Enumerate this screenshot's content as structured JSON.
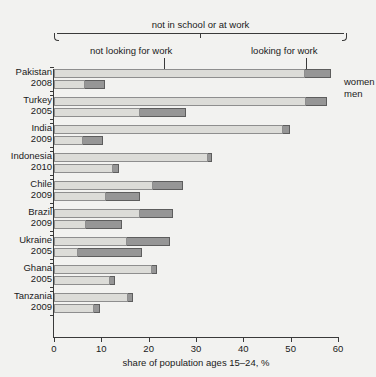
{
  "figure": {
    "cropped_headline": "issue",
    "annotations": {
      "overall_bracket": "not in school or at work",
      "left_segment": "not looking for work",
      "right_segment": "looking for work"
    },
    "legend": {
      "women": "women",
      "men": "men"
    },
    "colors": {
      "not_looking_for_work": "#dcdcd8",
      "looking_for_work": "#969696",
      "axis": "#3a3a3a",
      "background": "#f2f2f0"
    }
  },
  "chart_data": {
    "type": "bar",
    "orientation": "horizontal",
    "title": "",
    "xlabel": "share of population ages 15–24, %",
    "ylabel": "",
    "xlim": [
      0,
      60
    ],
    "xticks": [
      0,
      10,
      20,
      30,
      40,
      50,
      60
    ],
    "xticklabels": [
      "0",
      "10",
      "20",
      "30",
      "40",
      "50",
      "60"
    ],
    "grid": false,
    "legend_position": "right",
    "stacked": true,
    "series": [
      {
        "name": "not looking for work",
        "color": "#dcdcd8"
      },
      {
        "name": "looking for work",
        "color": "#969696"
      }
    ],
    "groups": [
      {
        "country": "Pakistan",
        "year": "2008",
        "bars": [
          {
            "sex": "women",
            "not_looking_for_work": 53.0,
            "looking_for_work": 5.5,
            "total": 58.5
          },
          {
            "sex": "men",
            "not_looking_for_work": 6.5,
            "looking_for_work": 4.3,
            "total": 10.8
          }
        ]
      },
      {
        "country": "Turkey",
        "year": "2005",
        "bars": [
          {
            "sex": "women",
            "not_looking_for_work": 53.2,
            "looking_for_work": 4.5,
            "total": 57.7
          },
          {
            "sex": "men",
            "not_looking_for_work": 18.2,
            "looking_for_work": 9.7,
            "total": 27.9
          }
        ]
      },
      {
        "country": "India",
        "year": "2009",
        "bars": [
          {
            "sex": "women",
            "not_looking_for_work": 48.4,
            "looking_for_work": 1.5,
            "total": 49.9
          },
          {
            "sex": "men",
            "not_looking_for_work": 6.1,
            "looking_for_work": 4.2,
            "total": 10.3
          }
        ]
      },
      {
        "country": "Indonesia",
        "year": "2010",
        "bars": [
          {
            "sex": "women",
            "not_looking_for_work": 32.5,
            "looking_for_work": 0.9,
            "total": 33.4
          },
          {
            "sex": "men",
            "not_looking_for_work": 12.5,
            "looking_for_work": 1.2,
            "total": 13.7
          }
        ]
      },
      {
        "country": "Chile",
        "year": "2009",
        "bars": [
          {
            "sex": "women",
            "not_looking_for_work": 20.9,
            "looking_for_work": 6.4,
            "total": 27.3
          },
          {
            "sex": "men",
            "not_looking_for_work": 11.0,
            "looking_for_work": 7.2,
            "total": 18.2
          }
        ]
      },
      {
        "country": "Brazil",
        "year": "2009",
        "bars": [
          {
            "sex": "women",
            "not_looking_for_work": 18.2,
            "looking_for_work": 6.9,
            "total": 25.1
          },
          {
            "sex": "men",
            "not_looking_for_work": 6.8,
            "looking_for_work": 7.6,
            "total": 14.4
          }
        ]
      },
      {
        "country": "Ukraine",
        "year": "2005",
        "bars": [
          {
            "sex": "women",
            "not_looking_for_work": 15.4,
            "looking_for_work": 9.1,
            "total": 24.5
          },
          {
            "sex": "men",
            "not_looking_for_work": 5.1,
            "looking_for_work": 13.5,
            "total": 18.6
          }
        ]
      },
      {
        "country": "Ghana",
        "year": "2005",
        "bars": [
          {
            "sex": "women",
            "not_looking_for_work": 20.7,
            "looking_for_work": 1.1,
            "total": 21.8
          },
          {
            "sex": "men",
            "not_looking_for_work": 11.8,
            "looking_for_work": 1.1,
            "total": 12.9
          }
        ]
      },
      {
        "country": "Tanzania",
        "year": "2009",
        "bars": [
          {
            "sex": "women",
            "not_looking_for_work": 15.6,
            "looking_for_work": 1.1,
            "total": 16.7
          },
          {
            "sex": "men",
            "not_looking_for_work": 8.4,
            "looking_for_work": 1.3,
            "total": 9.7
          }
        ]
      }
    ]
  }
}
